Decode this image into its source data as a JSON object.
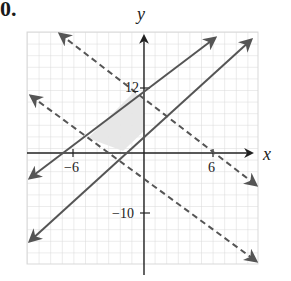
{
  "problem": {
    "number": "0."
  },
  "axes": {
    "x_label": "x",
    "y_label": "y",
    "x_ticks": [
      {
        "label": "−6",
        "value": -6
      },
      {
        "label": "6",
        "value": 6
      }
    ],
    "y_ticks": [
      {
        "label": "12",
        "value": 12
      },
      {
        "label": "−10",
        "value": -10
      }
    ]
  },
  "lines": [
    {
      "name": "upper-solid-line",
      "style": "solid",
      "arrows": "both"
    },
    {
      "name": "lower-solid-line",
      "style": "solid",
      "arrows": "both"
    },
    {
      "name": "upper-dashed-line",
      "style": "dashed",
      "arrows": "both"
    },
    {
      "name": "lower-dashed-line",
      "style": "dashed",
      "arrows": "both"
    }
  ],
  "shaded_region": {
    "description": "feasible region bounded by the four lines, left of the y-axis",
    "color": "#e6e6e6"
  },
  "colors": {
    "grid": "#d9d9d9",
    "axis": "#222222",
    "line": "#555555",
    "shade": "#e6e6e6"
  }
}
